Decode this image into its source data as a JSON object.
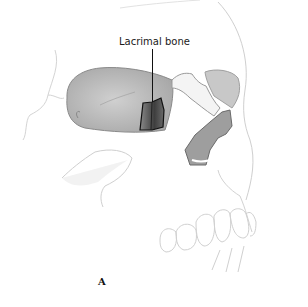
{
  "figure": {
    "label": "Lacrimal bone",
    "panel": "A",
    "colors": {
      "outline": "#c8c8c8",
      "orbit_fill": "#bdbdbd",
      "lacrimal_fill": "#555555",
      "nasal_fill": "#9a9a9a",
      "leader_line": "#111111"
    }
  }
}
